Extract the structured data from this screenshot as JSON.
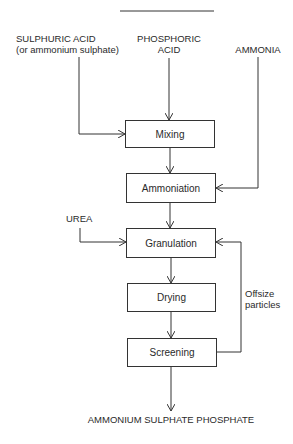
{
  "diagram": {
    "inputs": {
      "sulphuric_acid": {
        "line1": "SULPHURIC ACID",
        "line2": "(or ammonium sulphate)"
      },
      "phosphoric_acid": {
        "line1": "PHOSPHORIC",
        "line2": "ACID"
      },
      "ammonia": {
        "label": "AMMONIA"
      },
      "urea": {
        "label": "UREA"
      }
    },
    "steps": [
      {
        "label": "Mixing"
      },
      {
        "label": "Ammoniation"
      },
      {
        "label": "Granulation"
      },
      {
        "label": "Drying"
      },
      {
        "label": "Screening"
      }
    ],
    "recycle_label": {
      "line1": "Offsize",
      "line2": "particles"
    },
    "output": {
      "label": "AMMONIUM SULPHATE PHOSPHATE"
    }
  }
}
